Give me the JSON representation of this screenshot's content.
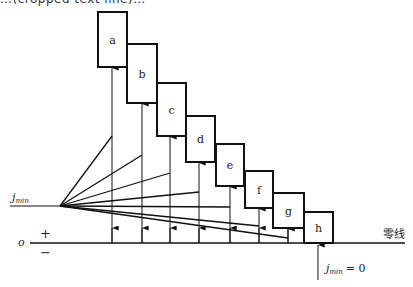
{
  "caption_top": "…(cropped text line)…",
  "diagram": {
    "boxes": [
      {
        "label": "a",
        "x": 98,
        "y": 12,
        "w": 29,
        "h": 55,
        "arrow_x": 112,
        "fan_end_y": 136
      },
      {
        "label": "b",
        "x": 127,
        "y": 44,
        "w": 30,
        "h": 59,
        "arrow_x": 142,
        "fan_end_y": 155
      },
      {
        "label": "c",
        "x": 157,
        "y": 83,
        "w": 29,
        "h": 53,
        "arrow_x": 170,
        "fan_end_y": 173
      },
      {
        "label": "d",
        "x": 186,
        "y": 116,
        "w": 29,
        "h": 46,
        "arrow_x": 199,
        "fan_end_y": 192
      },
      {
        "label": "e",
        "x": 216,
        "y": 144,
        "w": 28,
        "h": 42,
        "arrow_x": 230,
        "fan_end_y": 207
      },
      {
        "label": "f",
        "x": 245,
        "y": 171,
        "w": 28,
        "h": 37,
        "arrow_x": 259,
        "fan_end_y": 226
      },
      {
        "label": "g",
        "x": 273,
        "y": 193,
        "w": 31,
        "h": 35,
        "arrow_x": 288,
        "fan_end_y": 238
      },
      {
        "label": "h",
        "x": 304,
        "y": 212,
        "w": 29,
        "h": 31,
        "arrow_x": 318,
        "fan_end_y": null
      }
    ],
    "fan_origin": {
      "x": 60,
      "y": 206
    },
    "zero_line_y": 243,
    "labels": {
      "jmin_left": "j",
      "jmin_left_sub": "min",
      "origin": "o",
      "plus": "+",
      "minus": "−",
      "zero_line": "零线",
      "jmin_zero_j": "j",
      "jmin_zero_sub": "min",
      "jmin_zero_eq": "= 0"
    }
  }
}
